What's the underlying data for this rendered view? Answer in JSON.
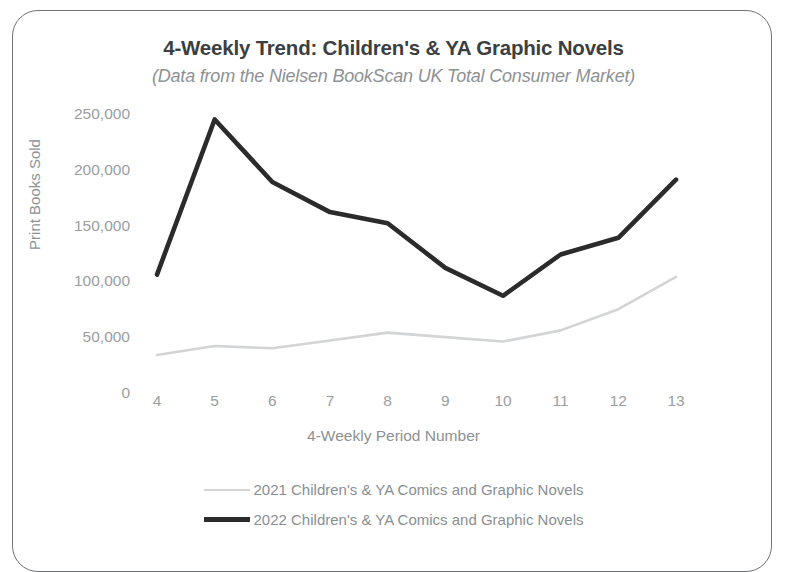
{
  "chart_data": {
    "type": "line",
    "title": "4-Weekly Trend: Children's & YA Graphic Novels",
    "subtitle": "(Data from the Nielsen BookScan UK Total Consumer Market)",
    "xlabel": "4-Weekly Period Number",
    "ylabel": "Print Books Sold",
    "categories": [
      4,
      5,
      6,
      7,
      8,
      9,
      10,
      11,
      12,
      13
    ],
    "xtick_labels": [
      "4",
      "5",
      "6",
      "7",
      "8",
      "9",
      "10",
      "11",
      "12",
      "13"
    ],
    "ytick_labels": [
      "250,000",
      "200,000",
      "150,000",
      "100,000",
      "50,000",
      "0"
    ],
    "ytick_values": [
      250000,
      200000,
      150000,
      100000,
      50000,
      0
    ],
    "ylim": [
      0,
      250000
    ],
    "xlim": [
      4,
      13
    ],
    "grid": false,
    "legend_position": "bottom",
    "series": [
      {
        "name": "2021 Children's & YA Comics and Graphic Novels",
        "color": "#d2d4d6",
        "values": [
          35000,
          43000,
          41000,
          48000,
          55000,
          51000,
          47000,
          57000,
          76000,
          105000
        ]
      },
      {
        "name": "2022 Children's & YA Comics and Graphic Novels",
        "color": "#2b2b2b",
        "values": [
          107000,
          246000,
          190000,
          163000,
          153000,
          113000,
          88000,
          125000,
          140000,
          192000
        ]
      }
    ]
  }
}
